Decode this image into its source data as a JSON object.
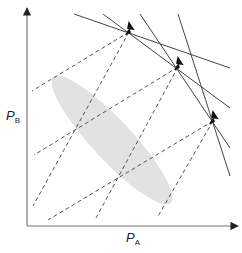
{
  "diagram": {
    "title": "",
    "axes": {
      "x_label": "P",
      "x_subscript": "A",
      "y_label": "P",
      "y_subscript": "B",
      "color": "#666666"
    },
    "ellipse": {
      "cx": 112,
      "cy": 140,
      "rx": 86,
      "ry": 20,
      "rotation": 47,
      "fill": "#e2e2e2"
    },
    "points": [
      {
        "id": "p1",
        "x": 129,
        "y": 32
      },
      {
        "id": "p2",
        "x": 178,
        "y": 67
      },
      {
        "id": "p3",
        "x": 213,
        "y": 121
      }
    ],
    "solid_lines": [
      {
        "x1": 74,
        "y1": 14,
        "x2": 230,
        "y2": 68
      },
      {
        "x1": 103,
        "y1": 14,
        "x2": 230,
        "y2": 108
      },
      {
        "x1": 140,
        "y1": 14,
        "x2": 230,
        "y2": 148
      },
      {
        "x1": 178,
        "y1": 14,
        "x2": 230,
        "y2": 176
      }
    ],
    "dashed_lines": [
      {
        "x1": 129,
        "y1": 32,
        "x2": 32,
        "y2": 91
      },
      {
        "x1": 129,
        "y1": 32,
        "x2": 33,
        "y2": 206
      },
      {
        "x1": 178,
        "y1": 67,
        "x2": 34,
        "y2": 155
      },
      {
        "x1": 178,
        "y1": 67,
        "x2": 96,
        "y2": 218
      },
      {
        "x1": 213,
        "y1": 121,
        "x2": 48,
        "y2": 220
      },
      {
        "x1": 213,
        "y1": 121,
        "x2": 157,
        "y2": 218
      }
    ],
    "line_color": "#444444",
    "dash_color": "#555555"
  }
}
